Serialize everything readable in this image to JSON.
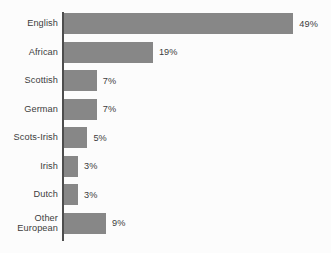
{
  "chart_data": {
    "type": "bar",
    "orientation": "horizontal",
    "title": "",
    "subtitle": "",
    "xlabel": "",
    "ylabel": "",
    "xlim": [
      0,
      49
    ],
    "grid": false,
    "legend": null,
    "value_suffix": "%",
    "categories": [
      "English",
      "African",
      "Scottish",
      "German",
      "Scots-Irish",
      "Irish",
      "Dutch",
      "Other\nEuropean"
    ],
    "values": [
      49,
      19,
      7,
      7,
      5,
      3,
      3,
      9
    ],
    "value_labels": [
      "49%",
      "19%",
      "7%",
      "7%",
      "5%",
      "3%",
      "3%",
      "9%"
    ],
    "colors": {
      "bar": "#878787",
      "axis": "#4d4d4d",
      "text": "#3c3c3c",
      "background": "#fcfcfc"
    }
  }
}
